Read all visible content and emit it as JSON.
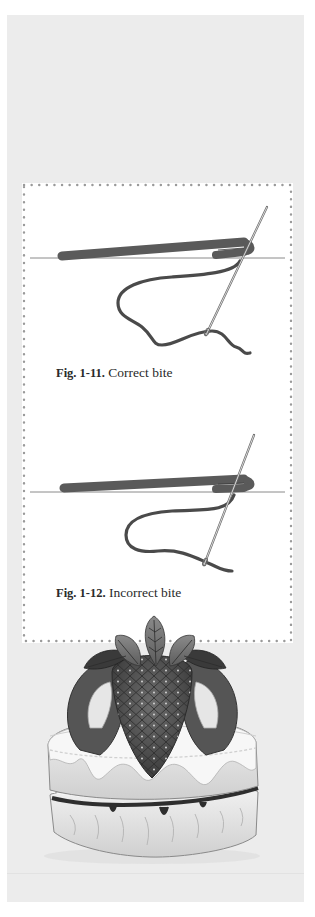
{
  "figures": [
    {
      "label": "Fig. 1-11.",
      "caption": "Correct bite",
      "illustration": "needle-thread-correct-bite"
    },
    {
      "label": "Fig. 1-12.",
      "caption": "Incorrect bite",
      "illustration": "needle-thread-incorrect-bite"
    }
  ],
  "decoration": {
    "image": "quilted-strawberry-cake-applique"
  },
  "colors": {
    "panel": "#ececec",
    "frame": "#ffffff",
    "dots": "#9a9a9a",
    "bar": "#5a5a5a",
    "thread": "#4a4a4a",
    "line": "#8a8a8a"
  }
}
